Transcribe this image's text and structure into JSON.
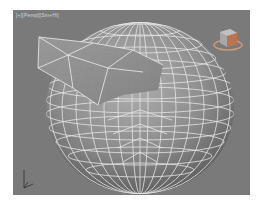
{
  "viewport": {
    "label": "[+][Persp][Sm+Hi]",
    "background_color": "#7a7a7a",
    "object": {
      "name": "sphere-with-beak",
      "display_mode": "shaded-with-edged-faces",
      "surface_color": "#8c8c8c",
      "wire_color": "#e8e8e8"
    },
    "viewcube": {
      "icon": "viewcube-icon"
    },
    "axis_tripod": {
      "icon": "axis-tripod-icon"
    }
  }
}
